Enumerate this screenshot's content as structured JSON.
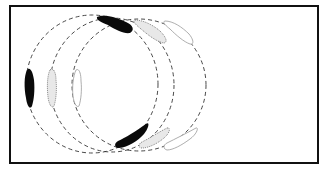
{
  "diagram": {
    "colors": {
      "frame": "#111111",
      "solid": "#0a0a0a",
      "stipple": "#777777",
      "outline": "#aaaaaa",
      "background": "#ffffff"
    },
    "orbits": [
      {
        "name": "orbit-1",
        "cx": 92,
        "cy": 84,
        "rx": 66,
        "ry": 69,
        "style": "solid"
      },
      {
        "name": "orbit-2",
        "cx": 112,
        "cy": 84,
        "rx": 62,
        "ry": 68,
        "style": "stipple"
      },
      {
        "name": "orbit-3",
        "cx": 139,
        "cy": 84,
        "rx": 67,
        "ry": 67,
        "style": "outline"
      }
    ]
  }
}
